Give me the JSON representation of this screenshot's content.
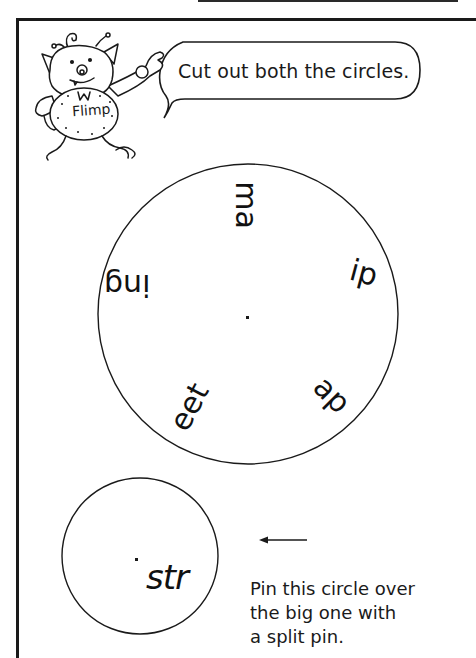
{
  "speech_bubble": {
    "text": "Cut out both the circles."
  },
  "character": {
    "name": "Flimp",
    "icon": "monster-mascot-icon"
  },
  "big_circle": {
    "segments": [
      {
        "label": "ma",
        "position": "top",
        "rotation_deg": 90
      },
      {
        "label": "ip",
        "position": "right",
        "rotation_deg": 0
      },
      {
        "label": "ap",
        "position": "lower-right",
        "rotation_deg": 45
      },
      {
        "label": "eet",
        "position": "bottom",
        "rotation_deg": -60
      },
      {
        "label": "ing",
        "position": "left",
        "rotation_deg": 180
      }
    ],
    "center_dot": true
  },
  "small_circle": {
    "label": "str",
    "center_dot": true
  },
  "instruction": {
    "arrow": "left-arrow-icon",
    "lines": [
      "Pin this circle over",
      "the big one with",
      "a split pin."
    ]
  }
}
